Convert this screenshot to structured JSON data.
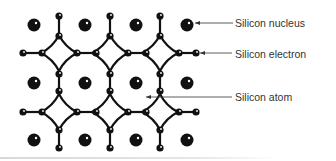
{
  "diagram": {
    "labels": [
      {
        "id": "nucleus",
        "text": "Silicon nucleus",
        "x": 235,
        "y": 17,
        "arrow_from": [
          233,
          23
        ],
        "arrow_to": [
          195,
          23
        ]
      },
      {
        "id": "electron",
        "text": "Silicon electron",
        "x": 235,
        "y": 48,
        "arrow_from": [
          232,
          53
        ],
        "arrow_to": [
          200,
          53
        ]
      },
      {
        "id": "atom",
        "text": "Silicon atom",
        "x": 235,
        "y": 91,
        "arrow_from": [
          232,
          97
        ],
        "arrow_to": [
          146,
          97
        ]
      }
    ],
    "colors": {
      "atom": "#111111",
      "label_text": "#333333",
      "arrow": "#333333",
      "background": "#ffffff"
    },
    "lattice": {
      "nucleus_columns": [
        34,
        85,
        136,
        187
      ],
      "nucleus_rows": [
        25,
        83,
        140
      ],
      "bond_columns": [
        59,
        110,
        160
      ],
      "bond_rows": [
        53,
        112
      ]
    }
  }
}
